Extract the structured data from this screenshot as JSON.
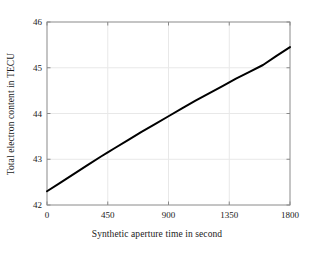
{
  "chart_data": {
    "type": "line",
    "title": "",
    "xlabel": "Synthetic aperture time in second",
    "ylabel": "Total electron content in TECU",
    "xlim": [
      0,
      1800
    ],
    "ylim": [
      42,
      46
    ],
    "xticks": [
      0,
      450,
      900,
      1350,
      1800
    ],
    "yticks": [
      42,
      43,
      44,
      45,
      46
    ],
    "xticklabels": [
      "0",
      "450",
      "900",
      "1350",
      "1800"
    ],
    "yticklabels": [
      "42",
      "43",
      "44",
      "45",
      "46"
    ],
    "grid": true,
    "grid_color": "#e8e8e8",
    "legend": null,
    "line_color": "#000000",
    "line_width": 2.0,
    "series": [
      {
        "name": "Total electron content",
        "x": [
          0,
          100,
          200,
          300,
          400,
          450,
          500,
          600,
          700,
          800,
          900,
          1000,
          1100,
          1200,
          1300,
          1350,
          1400,
          1500,
          1600,
          1700,
          1800
        ],
        "y": [
          42.3,
          42.49,
          42.68,
          42.87,
          43.06,
          43.15,
          43.24,
          43.42,
          43.6,
          43.77,
          43.94,
          44.11,
          44.28,
          44.44,
          44.6,
          44.68,
          44.76,
          44.91,
          45.06,
          45.26,
          45.45
        ]
      }
    ]
  },
  "figure": {
    "background_color": "#ffffff",
    "axes_color": "#808080",
    "text_color": "#1a1a1a"
  }
}
